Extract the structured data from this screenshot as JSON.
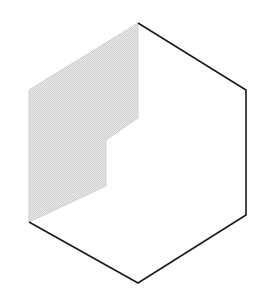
{
  "figure": {
    "canvas": {
      "width": 277,
      "height": 300,
      "background": "#ffffff"
    },
    "colors": {
      "background": "#ffffff",
      "outline": "#1a1a1a",
      "shaded_fill": "#dcdcdc",
      "shaded_fill_light": "#e8e8e8",
      "shaded_edge": "#d2d2d2",
      "unshaded_fill": "#ffffff"
    },
    "hexagon": {
      "name": "hexagon-outline",
      "vertices": [
        {
          "label": "top",
          "x": 138,
          "y": 23
        },
        {
          "label": "upper-right",
          "x": 246,
          "y": 90
        },
        {
          "label": "lower-right",
          "x": 246,
          "y": 215
        },
        {
          "label": "bottom",
          "x": 138,
          "y": 283
        },
        {
          "label": "lower-left",
          "x": 29,
          "y": 222
        },
        {
          "label": "upper-left",
          "x": 29,
          "y": 90
        }
      ],
      "stroked_path": "M138,23 L246,90 L246,215 L138,283 L29,222",
      "stroke_width": 1.6,
      "note": "Upper-left edges (lower-left to upper-left to top) are not stroked in black"
    },
    "shaded_region": {
      "name": "shaded-notched-region",
      "vertices": [
        {
          "x": 138,
          "y": 23
        },
        {
          "x": 138,
          "y": 118
        },
        {
          "x": 106,
          "y": 140
        },
        {
          "x": 106,
          "y": 186
        },
        {
          "x": 29,
          "y": 222
        },
        {
          "x": 29,
          "y": 90
        }
      ],
      "path": "M138,23 L138,118 L106,140 L106,186 L29,222 L29,90 Z",
      "fill_pattern": "checkerboard-dither",
      "pattern_cell_px": 2
    }
  }
}
